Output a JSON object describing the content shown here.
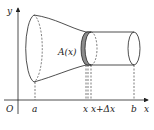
{
  "diagram": {
    "axes": {
      "x_label": "x",
      "y_label": "y",
      "origin_label": "O"
    },
    "cross_section_label": "A(x)",
    "tick_labels": {
      "a": "a",
      "x": "x",
      "x_plus_dx": "x+Δx",
      "b": "b"
    },
    "colors": {
      "stroke": "#222222",
      "slice_fill": "#8c8c8c",
      "background": "#ffffff"
    }
  }
}
